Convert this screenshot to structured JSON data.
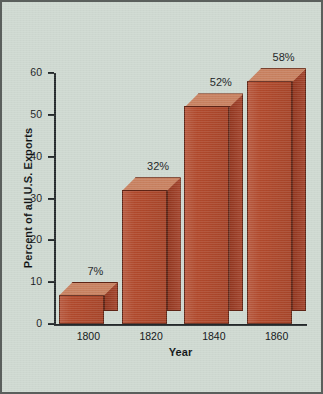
{
  "chart_data": {
    "type": "bar",
    "title": "",
    "subtitle": "",
    "xlabel": "Year",
    "ylabel": "Percent of all U.S. Exports",
    "categories": [
      "1800",
      "1820",
      "1840",
      "1860"
    ],
    "values": [
      7,
      32,
      52,
      58
    ],
    "data_labels": [
      "7%",
      "32%",
      "52%",
      "58%"
    ],
    "ylim": [
      0,
      60
    ],
    "yticks": [
      0,
      10,
      20,
      30,
      40,
      50,
      60
    ],
    "ytick_labels": [
      "0",
      "10",
      "20",
      "30",
      "40",
      "50",
      "60"
    ],
    "grid": false,
    "legend": null,
    "style": "3d-block",
    "colors": {
      "bar_front": "#b0492c",
      "bar_top": "#c7805f",
      "bar_side": "#9d3a21",
      "bar_edge": "#5e2415",
      "background": "#ced8d0",
      "frame": "#5a5f5c",
      "axis": "#23282a",
      "text": "#16191b"
    }
  }
}
